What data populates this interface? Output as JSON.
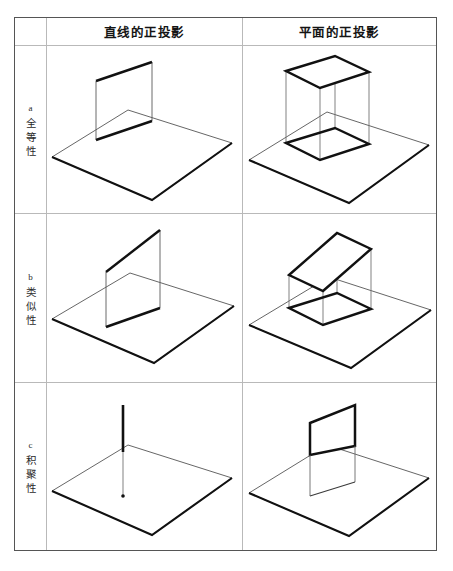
{
  "top_caption": "",
  "table": {
    "headers": {
      "corner": "",
      "line_projection": "直线的正投影",
      "plane_projection": "平面的正投影"
    },
    "rows": [
      {
        "tag": "a",
        "label_chars": [
          "全",
          "等",
          "性"
        ],
        "label_full": "a 全等性",
        "line_cell_name": "congruence-line-diagram",
        "plane_cell_name": "congruence-plane-diagram",
        "line_description": "与投影面平行的直线,其投影与原直线等长",
        "plane_description": "与投影面平行的平面,其投影与原平面全等"
      },
      {
        "tag": "b",
        "label_chars": [
          "类",
          "似",
          "性"
        ],
        "label_full": "b 类似性",
        "line_cell_name": "similarity-line-diagram",
        "plane_cell_name": "similarity-plane-diagram",
        "line_description": "与投影面倾斜的直线,其投影比原直线短",
        "plane_description": "与投影面倾斜的平面,其投影为类似形"
      },
      {
        "tag": "c",
        "label_chars": [
          "积",
          "聚",
          "性"
        ],
        "label_full": "c 积聚性",
        "line_cell_name": "accumulation-line-diagram",
        "plane_cell_name": "accumulation-plane-diagram",
        "line_description": "与投影面垂直的直线,其投影积聚为一点",
        "plane_description": "与投影面垂直的平面,其投影积聚为一直线"
      }
    ]
  },
  "colors": {
    "ink": "#111111",
    "thin_line": "#4a4a4a",
    "border_outer": "#555555",
    "border_inner": "#b9b9b9",
    "page_background": "#ffffff"
  }
}
